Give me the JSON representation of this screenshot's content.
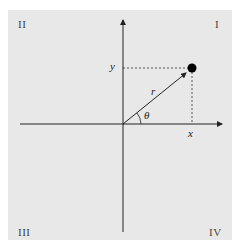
{
  "quadrants": {
    "q1": "I",
    "q2": "II",
    "q3": "III",
    "q4": "IV"
  },
  "labels": {
    "x": "x",
    "y": "y",
    "r": "r",
    "theta": "θ"
  },
  "colors": {
    "background": "#e8e8e8",
    "axis": "#222222",
    "point": "#000000"
  }
}
